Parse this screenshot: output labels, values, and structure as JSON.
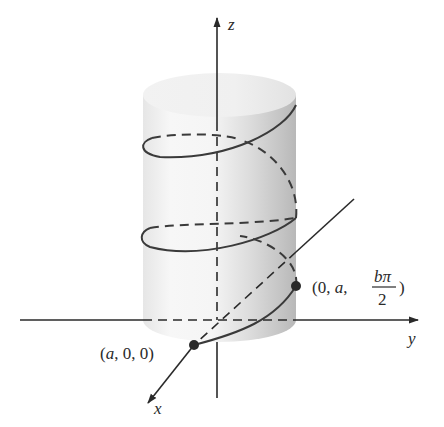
{
  "figure": {
    "axes": {
      "z_label": "z",
      "y_label": "y",
      "x_label": "x"
    },
    "points": [
      {
        "id": "p1",
        "label": "(a, 0, 0)",
        "parts": [
          "(",
          "a",
          ", 0, 0)"
        ]
      },
      {
        "id": "p2",
        "label": "(0, a, bπ/2)",
        "prefix": "(0, ",
        "a": "a",
        "sep": ", ",
        "num": "bπ",
        "den": "2",
        "close": ")"
      }
    ],
    "colors": {
      "axis": "#2a2a2a",
      "helix": "#3a3a3a",
      "cylinder_light": "#f4f4f4",
      "cylinder_shade": "#bdbdbd",
      "point": "#2a2a2a"
    }
  }
}
